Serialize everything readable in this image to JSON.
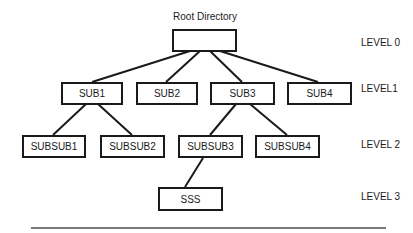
{
  "diagram": {
    "title": "Root Directory",
    "root": {
      "label": ""
    },
    "level1": [
      "SUB1",
      "SUB2",
      "SUB3",
      "SUB4"
    ],
    "level2": [
      "SUBSUB1",
      "SUBSUB2",
      "SUBSUB3",
      "SUBSUB4"
    ],
    "level3": [
      "SSS"
    ],
    "levels": [
      "LEVEL 0",
      "LEVEL1",
      "LEVEL 2",
      "LEVEL 3"
    ],
    "edges": [
      [
        "Root",
        "SUB1"
      ],
      [
        "Root",
        "SUB2"
      ],
      [
        "Root",
        "SUB3"
      ],
      [
        "Root",
        "SUB4"
      ],
      [
        "SUB1",
        "SUBSUB1"
      ],
      [
        "SUB1",
        "SUBSUB2"
      ],
      [
        "SUB3",
        "SUBSUB3"
      ],
      [
        "SUB3",
        "SUBSUB4"
      ],
      [
        "SUBSUB3",
        "SSS"
      ]
    ],
    "colors": {
      "stroke": "#1a1a1a",
      "divider": "#7a7a7a",
      "background": "#ffffff"
    }
  }
}
